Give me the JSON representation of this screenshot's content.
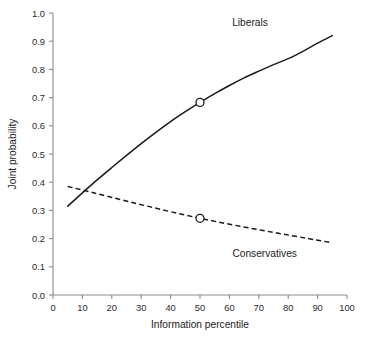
{
  "chart_data": {
    "type": "line",
    "title": "",
    "xlabel": "Information percentile",
    "ylabel": "Joint probability",
    "xlim": [
      0,
      100
    ],
    "ylim": [
      0.0,
      1.0
    ],
    "grid": false,
    "legend_position": "inline-annotation",
    "xticks": [
      0,
      10,
      20,
      30,
      40,
      50,
      60,
      70,
      80,
      90,
      100
    ],
    "xtick_labels": [
      "0",
      "10",
      "20",
      "30",
      "40",
      "50",
      "60",
      "70",
      "80",
      "90",
      "100"
    ],
    "yticks": [
      0.0,
      0.1,
      0.2,
      0.3,
      0.4,
      0.5,
      0.6,
      0.7,
      0.8,
      0.9,
      1.0
    ],
    "ytick_labels": [
      "0.0",
      "0.1",
      "0.2",
      "0.3",
      "0.4",
      "0.5",
      "0.6",
      "0.7",
      "0.8",
      "0.9",
      "1.0"
    ],
    "series": [
      {
        "name": "Liberals",
        "style": "solid",
        "color": "#1a1a1a",
        "label_text": "Liberals",
        "x": [
          5,
          10,
          15,
          20,
          25,
          30,
          35,
          40,
          45,
          50,
          55,
          60,
          65,
          70,
          75,
          80,
          85,
          90,
          95
        ],
        "values": [
          0.315,
          0.362,
          0.408,
          0.452,
          0.495,
          0.537,
          0.577,
          0.615,
          0.65,
          0.683,
          0.714,
          0.743,
          0.77,
          0.794,
          0.817,
          0.838,
          0.864,
          0.893,
          0.92
        ],
        "marker_point": {
          "x": 50,
          "y": 0.683
        }
      },
      {
        "name": "Conservatives",
        "style": "dashed",
        "color": "#1a1a1a",
        "label_text": "Conservatives",
        "x": [
          5,
          50,
          95
        ],
        "values": [
          0.385,
          0.272,
          0.185
        ],
        "marker_point": {
          "x": 50,
          "y": 0.272
        }
      }
    ],
    "annotations": [
      {
        "text": "Liberals",
        "x": 67,
        "y": 0.955
      },
      {
        "text": "Conservatives",
        "x": 72,
        "y": 0.135
      }
    ]
  },
  "axes": {
    "y_axis_label": "Joint probability",
    "x_axis_label": "Information percentile"
  },
  "caption": {
    "partial_text": ""
  }
}
